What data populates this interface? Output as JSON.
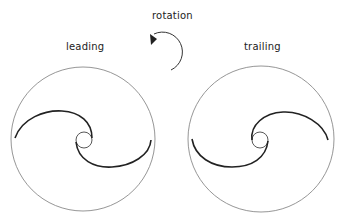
{
  "labels": {
    "rotation": "rotation",
    "leading": "leading",
    "trailing": "trailing"
  },
  "colors": {
    "outline": "#888888",
    "blade": "#222222",
    "arrow": "#333333"
  },
  "diagram": {
    "rotation_direction": "counterclockwise",
    "panels": [
      {
        "name": "leading",
        "circle": {
          "cx": 83,
          "cy": 139,
          "r": 72
        }
      },
      {
        "name": "trailing",
        "circle": {
          "cx": 261,
          "cy": 139,
          "r": 73
        }
      }
    ]
  }
}
